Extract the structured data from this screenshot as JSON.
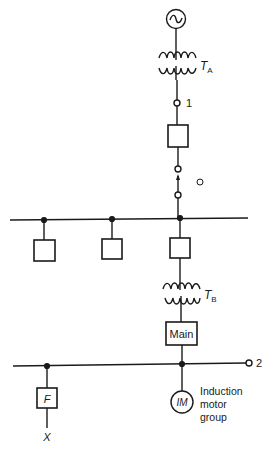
{
  "diagram": {
    "type": "single-line power system diagram",
    "components": {
      "generator": {
        "label": "",
        "icon": "ac-generator-icon"
      },
      "transformer_a": {
        "label": "T",
        "subscript": "A"
      },
      "transformer_b": {
        "label": "T",
        "subscript": "B"
      },
      "node_1": {
        "label": "1"
      },
      "node_2": {
        "label": "2"
      },
      "main_breaker": {
        "label": "Main"
      },
      "feeder_breaker": {
        "label": "F"
      },
      "fault_point": {
        "label": "X"
      },
      "induction_motor": {
        "label": "IM"
      },
      "induction_motor_desc": {
        "line1": "Induction",
        "line2": "motor",
        "line3": "group"
      }
    },
    "colors": {
      "line": "#1a1a1a",
      "background": "#ffffff"
    }
  }
}
